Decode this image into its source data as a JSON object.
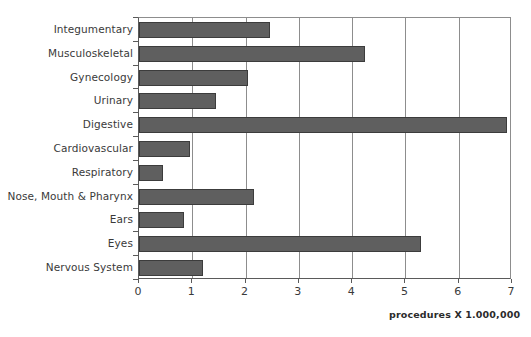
{
  "chart_data": {
    "type": "bar",
    "orientation": "horizontal",
    "title": "",
    "subtitle": "",
    "xlabel": "procedures X 1.000,000",
    "ylabel": "",
    "xlim": [
      0,
      7
    ],
    "ylim": null,
    "grid": true,
    "grid_axis": "x",
    "legend": false,
    "legend_position": "none",
    "annotations": [
      "procedures X 1.000,000"
    ],
    "xticks": [
      "0",
      "1",
      "2",
      "3",
      "4",
      "5",
      "6",
      "7"
    ],
    "categories": [
      "Integumentary",
      "Musculoskeletal",
      "Gynecology",
      "Urinary",
      "Digestive",
      "Cardiovascular",
      "Respiratory",
      "Nose, Mouth & Pharynx",
      "Ears",
      "Eyes",
      "Nervous System"
    ],
    "values": [
      2.45,
      4.25,
      2.05,
      1.45,
      6.9,
      0.95,
      0.45,
      2.15,
      0.85,
      5.3,
      1.2
    ],
    "bar_color": "#5f5f5f",
    "bar_edge_color": "#3c3c3c",
    "axis_color": "#5a5a5a",
    "grid_color": "#8d8d8d",
    "background_color": "#ffffff"
  },
  "caption": {
    "text": "procedures X 1.000,000"
  }
}
